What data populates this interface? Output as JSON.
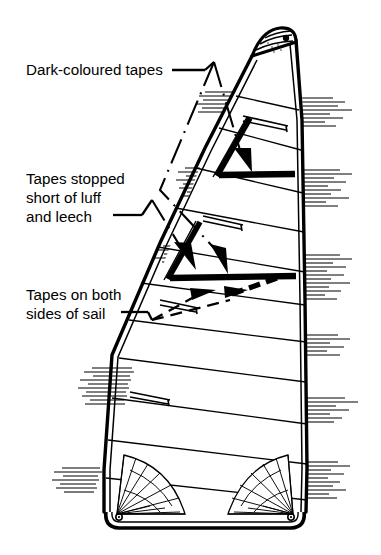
{
  "figure": {
    "background_color": "#ffffff",
    "ink_color": "#000000",
    "width": 381,
    "height": 555
  },
  "annotations": [
    {
      "id": "dark-coloured-tapes",
      "lines": [
        "Dark-coloured tapes"
      ],
      "leader_style": "dash-dot",
      "arrowheads": 2,
      "text_x": 26,
      "text_y": 75
    },
    {
      "id": "tapes-stopped-short",
      "lines": [
        "Tapes stopped",
        "short of luff",
        "and leech"
      ],
      "leader_style": "dash-dot",
      "arrowheads": 1,
      "text_x": 26,
      "text_y": 184
    },
    {
      "id": "tapes-both-sides",
      "lines": [
        "Tapes on both",
        "sides of sail"
      ],
      "leader_style": "dashed",
      "arrowheads": 2,
      "text_x": 26,
      "text_y": 300
    }
  ],
  "sail": {
    "parts": {
      "head": "headboard with eyelet",
      "luff": "leading edge, double line, hatched",
      "leech": "trailing edge, double line, hatched",
      "foot": "bottom edge, double line",
      "tack": "lower forward corner with radial patch",
      "clew": "lower aft corner with radial patch"
    },
    "tape_count": 2,
    "tape_color": "#000000",
    "seam_count": 11,
    "corner_patches": 2,
    "eyelets": 3
  }
}
